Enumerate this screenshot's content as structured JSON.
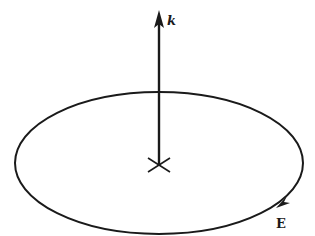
{
  "diagram": {
    "labels": {
      "k": "k",
      "E": "E"
    },
    "colors": {
      "ink": "#1a1a1a",
      "background": "#ffffff"
    }
  }
}
